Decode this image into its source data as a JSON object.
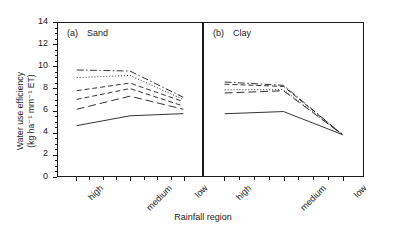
{
  "axes": {
    "y_title_line1": "Water use efficiency",
    "y_title_line2": "(kg ha⁻¹ mm⁻¹ ET)",
    "x_title": "Rainfall region",
    "y_ticks": [
      "0",
      "2",
      "4",
      "6",
      "8",
      "10",
      "12",
      "14"
    ],
    "x_ticks": [
      "high",
      "medium",
      "low"
    ]
  },
  "panels": {
    "a": {
      "tag": "(a)",
      "name": "Sand"
    },
    "b": {
      "tag": "(b)",
      "name": "Clay"
    }
  },
  "chart_data": {
    "type": "line",
    "title": "",
    "xlabel": "Rainfall region",
    "ylabel": "Water use efficiency (kg ha⁻¹ mm⁻¹ ET)",
    "ylim": [
      0,
      14
    ],
    "ytick_step": 2,
    "grid": false,
    "legend": "none",
    "categories": [
      "high",
      "medium",
      "low"
    ],
    "panels": [
      {
        "key": "a",
        "label": "(a)  Sand",
        "series": [
          {
            "name": "series-1",
            "style": "dash-dot",
            "values": [
              9.7,
              9.6,
              7.2
            ]
          },
          {
            "name": "series-2",
            "style": "dotted",
            "values": [
              9.0,
              9.2,
              7.0
            ]
          },
          {
            "name": "series-3",
            "style": "dashed",
            "values": [
              7.8,
              8.5,
              6.8
            ]
          },
          {
            "name": "series-4",
            "style": "dashed",
            "values": [
              7.0,
              8.0,
              6.4
            ]
          },
          {
            "name": "series-5",
            "style": "long-dash",
            "values": [
              6.1,
              7.3,
              6.1
            ]
          },
          {
            "name": "series-6",
            "style": "solid",
            "values": [
              4.6,
              5.5,
              5.7
            ]
          }
        ]
      },
      {
        "key": "b",
        "label": "(b)  Clay",
        "series": [
          {
            "name": "series-1",
            "style": "dash-dot",
            "values": [
              8.6,
              8.3,
              3.8
            ]
          },
          {
            "name": "series-2",
            "style": "dashed",
            "values": [
              8.4,
              8.2,
              3.8
            ]
          },
          {
            "name": "series-3",
            "style": "dotted",
            "values": [
              7.9,
              7.9,
              3.8
            ]
          },
          {
            "name": "series-4",
            "style": "long-dash",
            "values": [
              7.6,
              7.8,
              3.8
            ]
          },
          {
            "name": "series-5",
            "style": "solid",
            "values": [
              5.7,
              5.9,
              3.8
            ]
          }
        ]
      }
    ]
  }
}
